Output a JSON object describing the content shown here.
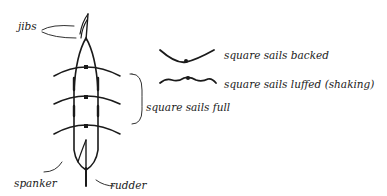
{
  "diagram": {
    "type": "sailing-ship-top-view",
    "labels": {
      "jibs": "jibs",
      "spanker": "spanker",
      "rudder": "rudder",
      "square_sails_full": "square sails full",
      "square_sails_backed": "square sails backed",
      "square_sails_luffed": "square sails luffed (shaking)"
    },
    "legend": [
      {
        "symbol": "backed-curve",
        "label": "square sails backed"
      },
      {
        "symbol": "luffed-wavy-curve",
        "label": "square sails luffed (shaking)"
      }
    ],
    "colors": {
      "ink": "#1a1a1a",
      "background": "#ffffff"
    }
  }
}
